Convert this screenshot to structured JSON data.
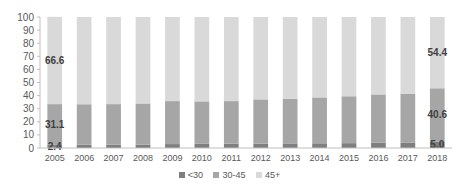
{
  "chart_data": {
    "type": "bar",
    "stacked": true,
    "title": "",
    "xlabel": "",
    "ylabel": "",
    "ylim": [
      0,
      100
    ],
    "yticks": [
      0,
      10,
      20,
      30,
      40,
      50,
      60,
      70,
      80,
      90,
      100
    ],
    "grid": false,
    "legend_position": "bottom",
    "categories": [
      "2005",
      "2006",
      "2007",
      "2008",
      "2009",
      "2010",
      "2011",
      "2012",
      "2013",
      "2014",
      "2015",
      "2016",
      "2017",
      "2018"
    ],
    "series": [
      {
        "name": "<30",
        "color": "#7f7f7f",
        "values": [
          2.4,
          2.5,
          2.6,
          2.6,
          3.0,
          3.2,
          3.3,
          3.4,
          3.5,
          3.6,
          3.7,
          4.0,
          4.2,
          5.0
        ]
      },
      {
        "name": "30-45",
        "color": "#a6a6a6",
        "values": [
          31.1,
          30.9,
          30.9,
          31.4,
          32.8,
          32.4,
          32.5,
          33.7,
          34.1,
          35.0,
          35.8,
          36.9,
          37.2,
          40.6
        ]
      },
      {
        "name": "45+",
        "color": "#d9d9d9",
        "values": [
          66.6,
          66.6,
          66.5,
          66.0,
          64.2,
          64.4,
          64.2,
          62.9,
          62.4,
          61.4,
          60.5,
          59.1,
          58.6,
          54.4
        ]
      }
    ],
    "data_labels": [
      {
        "category": "2005",
        "series": "<30",
        "text": "2.4"
      },
      {
        "category": "2005",
        "series": "30-45",
        "text": "31.1"
      },
      {
        "category": "2005",
        "series": "45+",
        "text": "66.6"
      },
      {
        "category": "2018",
        "series": "<30",
        "text": "5.0"
      },
      {
        "category": "2018",
        "series": "30-45",
        "text": "40.6"
      },
      {
        "category": "2018",
        "series": "45+",
        "text": "54.4"
      }
    ]
  },
  "legend": {
    "items": [
      {
        "label": "<30",
        "color": "#7f7f7f"
      },
      {
        "label": "30-45",
        "color": "#a6a6a6"
      },
      {
        "label": "45+",
        "color": "#d9d9d9"
      }
    ]
  }
}
